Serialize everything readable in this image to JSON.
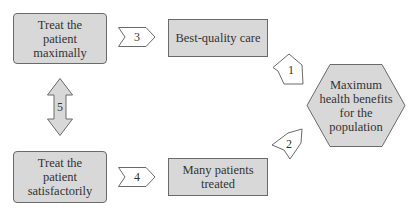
{
  "diagram": {
    "nodes": {
      "maximal": {
        "label": "Treat the patient maximally",
        "lines": [
          "Treat the",
          "patient",
          "maximally"
        ]
      },
      "quality": {
        "label": "Best-quality care"
      },
      "satisfactory": {
        "label": "Treat the patient satisfactorily",
        "lines": [
          "Treat the",
          "patient",
          "satisfactorily"
        ]
      },
      "many": {
        "label": "Many patients treated",
        "lines": [
          "Many patients",
          "treated"
        ]
      },
      "goal": {
        "label": "Maximum health benefits for the population",
        "lines": [
          "Maximum",
          "health benefits",
          "for the",
          "population"
        ]
      }
    },
    "arrows": {
      "a1": {
        "label": "1",
        "from": "Best-quality care",
        "to": "Maximum health benefits for the population"
      },
      "a2": {
        "label": "2",
        "from": "Many patients treated",
        "to": "Maximum health benefits for the population"
      },
      "a3": {
        "label": "3",
        "from": "Treat the patient maximally",
        "to": "Best-quality care"
      },
      "a4": {
        "label": "4",
        "from": "Treat the patient satisfactorily",
        "to": "Many patients treated"
      },
      "a5": {
        "label": "5",
        "from": "Treat the patient maximally",
        "to": "Treat the patient satisfactorily",
        "bidirectional": true
      }
    },
    "colors": {
      "fill": "#d8d8d8",
      "stroke": "#6a6a6a",
      "text": "#333333",
      "background": "#ffffff"
    }
  }
}
